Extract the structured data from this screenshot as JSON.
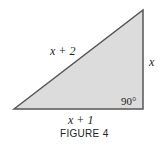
{
  "figure": {
    "caption": "FIGURE 4",
    "shape": "right-triangle",
    "fill_color": "#dcdcdc",
    "stroke_color": "#555555",
    "labels": {
      "hypotenuse": "x + 2",
      "vertical_leg": "x",
      "base": "x + 1",
      "right_angle": "90°"
    }
  }
}
